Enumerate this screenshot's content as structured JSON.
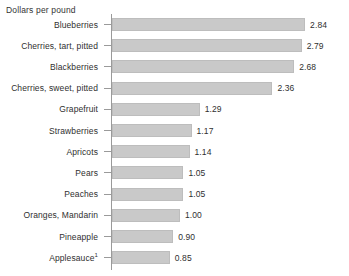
{
  "chart_data": {
    "type": "bar",
    "orientation": "horizontal",
    "title": "",
    "xlabel": "Dollars per pound",
    "ylabel": "",
    "axis_title": "Dollars per pound",
    "grid": false,
    "legend": false,
    "xlim": [
      0,
      2.84
    ],
    "categories": [
      "Blueberries",
      "Cherries, tart, pitted",
      "Blackberries",
      "Cherries, sweet, pitted",
      "Grapefruit",
      "Strawberries",
      "Apricots",
      "Pears",
      "Peaches",
      "Oranges, Mandarin",
      "Pineapple",
      "Applesauce"
    ],
    "values": [
      2.84,
      2.79,
      2.68,
      2.36,
      1.29,
      1.17,
      1.14,
      1.05,
      1.05,
      1.0,
      0.9,
      0.85
    ],
    "value_labels": [
      "2.84",
      "2.79",
      "2.68",
      "2.36",
      "1.29",
      "1.17",
      "1.14",
      "1.05",
      "1.05",
      "1.00",
      "0.90",
      "0.85"
    ],
    "footnote_markers": [
      "",
      "",
      "",
      "",
      "",
      "",
      "",
      "",
      "",
      "",
      "",
      "1"
    ],
    "bar_color": "#c9c9c9",
    "bar_border_color": "#bdbdbd",
    "axis_color": "#9a9a9a",
    "text_color": "#2f2f2f",
    "background_color": "#ffffff"
  },
  "rows": [
    {
      "label": "Blueberries",
      "value_label": "2.84",
      "sup": ""
    },
    {
      "label": "Cherries, tart, pitted",
      "value_label": "2.79",
      "sup": ""
    },
    {
      "label": "Blackberries",
      "value_label": "2.68",
      "sup": ""
    },
    {
      "label": "Cherries, sweet, pitted",
      "value_label": "2.36",
      "sup": ""
    },
    {
      "label": "Grapefruit",
      "value_label": "1.29",
      "sup": ""
    },
    {
      "label": "Strawberries",
      "value_label": "1.17",
      "sup": ""
    },
    {
      "label": "Apricots",
      "value_label": "1.14",
      "sup": ""
    },
    {
      "label": "Pears",
      "value_label": "1.05",
      "sup": ""
    },
    {
      "label": "Peaches",
      "value_label": "1.05",
      "sup": ""
    },
    {
      "label": "Oranges, Mandarin",
      "value_label": "1.00",
      "sup": ""
    },
    {
      "label": "Pineapple",
      "value_label": "0.90",
      "sup": ""
    },
    {
      "label": "Applesauce",
      "value_label": "0.85",
      "sup": "1"
    }
  ]
}
